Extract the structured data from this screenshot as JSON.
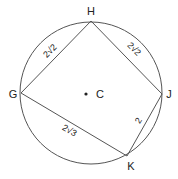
{
  "diagram": {
    "type": "inscribed-quadrilateral",
    "circle": {
      "center_label": "C",
      "cx": 91,
      "cy": 93,
      "r": 71
    },
    "points": {
      "H": {
        "x": 91,
        "y": 21
      },
      "J": {
        "x": 162,
        "y": 94
      },
      "K": {
        "x": 127,
        "y": 156
      },
      "G": {
        "x": 21,
        "y": 93
      }
    },
    "sides": [
      {
        "from": "G",
        "to": "H",
        "label": "2√2"
      },
      {
        "from": "H",
        "to": "J",
        "label": "2√2"
      },
      {
        "from": "J",
        "to": "K",
        "label": "2"
      },
      {
        "from": "K",
        "to": "G",
        "label": "2√3"
      }
    ],
    "vertex_labels": {
      "H": "H",
      "J": "J",
      "K": "K",
      "G": "G",
      "C": "C"
    },
    "colors": {
      "stroke": "#555555",
      "text": "#222222",
      "background": "#ffffff"
    }
  }
}
